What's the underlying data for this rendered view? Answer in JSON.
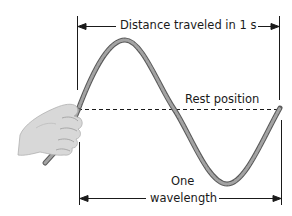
{
  "diagram": {
    "labels": {
      "distance": "Distance traveled in 1 s",
      "rest": "Rest position",
      "wavelength_line1": "One",
      "wavelength_line2": "wavelength"
    },
    "elements": [
      "hand holding rope",
      "sine wave rope",
      "dashed rest-position line",
      "distance arrow",
      "wavelength arrow"
    ],
    "colors": {
      "rope": "#8f8f8f",
      "rope_edge": "#5a5a5a",
      "hand": "#d6d6d6",
      "lines": "#1a1a1a"
    }
  }
}
